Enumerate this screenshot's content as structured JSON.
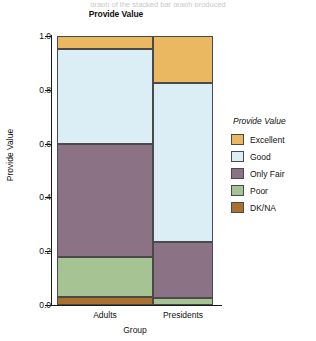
{
  "page": {
    "top_caption": "graph of the stacked bar graph produced"
  },
  "chart_data": {
    "type": "bar",
    "subtype": "stacked-percent",
    "title": "Provide Value",
    "xlabel": "Group",
    "ylabel": "Provide Value",
    "categories": [
      "Adults",
      "Presidents"
    ],
    "ylim": [
      0.0,
      1.0
    ],
    "yticks": [
      "0.0",
      "0.2",
      "0.4",
      "0.6",
      "0.8",
      "1.0"
    ],
    "ytick_values": [
      0.0,
      0.2,
      0.4,
      0.6,
      0.8,
      1.0
    ],
    "grid": false,
    "legend_title": "Provide Value",
    "legend_position": "right",
    "series": [
      {
        "name": "Excellent",
        "color": "#eab860",
        "values": [
          0.05,
          0.175
        ]
      },
      {
        "name": "Good",
        "color": "#dbeef5",
        "values": [
          0.35,
          0.59
        ]
      },
      {
        "name": "Only Fair",
        "color": "#8b7284",
        "values": [
          0.42,
          0.21
        ]
      },
      {
        "name": "Poor",
        "color": "#a6c493",
        "values": [
          0.15,
          0.025
        ]
      },
      {
        "name": "DK/NA",
        "color": "#a9702e",
        "values": [
          0.03,
          0.0
        ]
      }
    ],
    "stack_bounds": {
      "Adults": [
        {
          "name": "Excellent",
          "from": 0.95,
          "to": 1.0
        },
        {
          "name": "Good",
          "from": 0.6,
          "to": 0.95
        },
        {
          "name": "Only Fair",
          "from": 0.18,
          "to": 0.6
        },
        {
          "name": "Poor",
          "from": 0.03,
          "to": 0.18
        },
        {
          "name": "DK/NA",
          "from": 0.0,
          "to": 0.03
        }
      ],
      "Presidents": [
        {
          "name": "Excellent",
          "from": 0.825,
          "to": 1.0
        },
        {
          "name": "Good",
          "from": 0.235,
          "to": 0.825
        },
        {
          "name": "Only Fair",
          "from": 0.025,
          "to": 0.235
        },
        {
          "name": "Poor",
          "from": 0.0,
          "to": 0.025
        },
        {
          "name": "DK/NA",
          "from": 0.0,
          "to": 0.0
        }
      ]
    }
  }
}
